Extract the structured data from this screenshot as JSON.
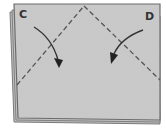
{
  "diagram": {
    "type": "folding-instruction",
    "labels": {
      "left_corner": "C",
      "right_corner": "D"
    },
    "colors": {
      "paper": "#c8c8c8",
      "edge": "#6a6a6a",
      "ink": "#333333"
    },
    "elements": [
      {
        "kind": "paper-sheet",
        "description": "square sheet with layered bottom-left edge"
      },
      {
        "kind": "dashed-fold-line",
        "from": "left edge",
        "to": "top center"
      },
      {
        "kind": "dashed-fold-line",
        "from": "top center",
        "to": "right edge"
      },
      {
        "kind": "curved-arrow",
        "direction": "down-right",
        "from": "corner C"
      },
      {
        "kind": "curved-arrow",
        "direction": "down-left",
        "from": "corner D"
      }
    ]
  }
}
